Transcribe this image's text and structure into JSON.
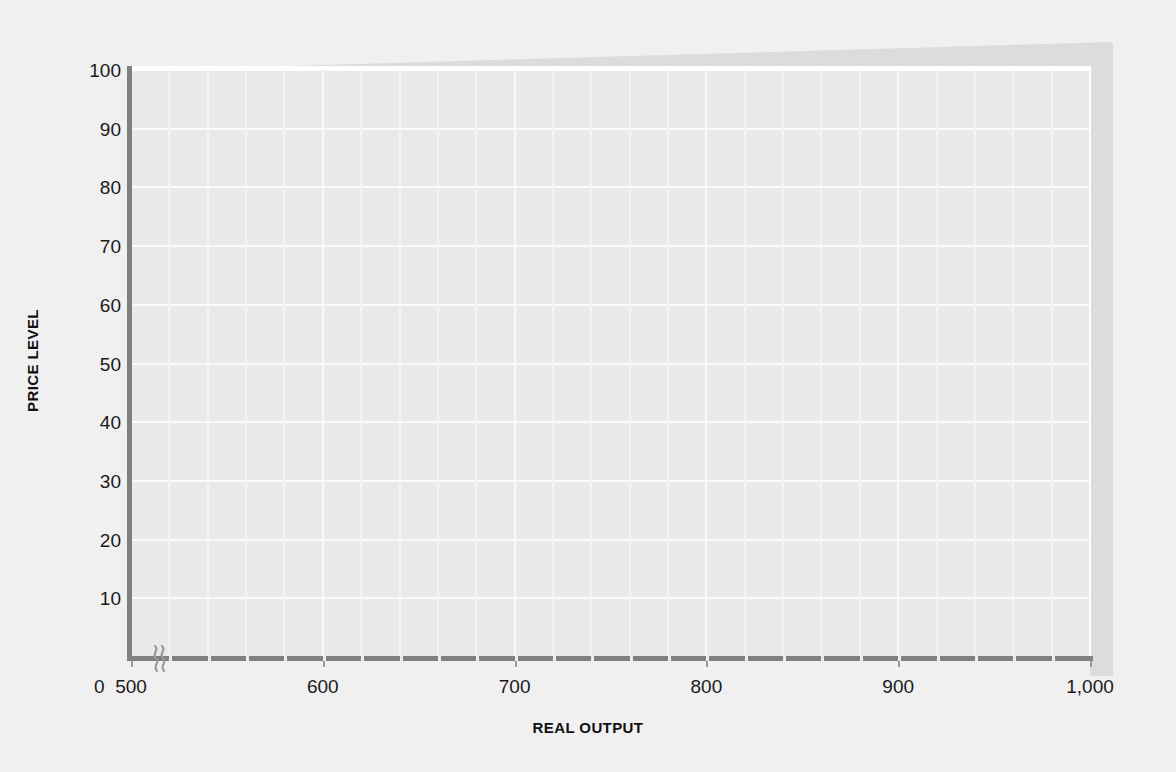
{
  "chart_data": {
    "type": "line",
    "title": "",
    "subtitle": "",
    "xlabel": "REAL OUTPUT",
    "ylabel": "PRICE LEVEL",
    "xlim": [
      500,
      1000
    ],
    "ylim": [
      0,
      100
    ],
    "x_ticks": [
      500,
      600,
      700,
      800,
      900,
      1000
    ],
    "x_tick_labels": [
      "500",
      "600",
      "700",
      "800",
      "900",
      "1,000"
    ],
    "x_origin_label": "0",
    "x_axis_break": true,
    "y_ticks": [
      10,
      20,
      30,
      40,
      50,
      60,
      70,
      80,
      90,
      100
    ],
    "y_tick_labels": [
      "10",
      "20",
      "30",
      "40",
      "50",
      "60",
      "70",
      "80",
      "90",
      "100"
    ],
    "grid": true,
    "legend": "none",
    "series": [],
    "annotations": [],
    "colors": {
      "page_background": "#f0f0f0",
      "plot_background": "#eaeaea",
      "gridline": "#fbfbfb",
      "axis_line": "#808080",
      "bevel": "#dcdcdc",
      "text": "#1a1a1a"
    }
  },
  "figure": {
    "y_axis_title": "PRICE LEVEL",
    "x_axis_title": "REAL OUTPUT",
    "origin_label": "0",
    "y_labels": [
      "100",
      "90",
      "80",
      "70",
      "60",
      "50",
      "40",
      "30",
      "20",
      "10"
    ],
    "x_labels": [
      "500",
      "600",
      "700",
      "800",
      "900",
      "1,000"
    ],
    "break_icon": "axis-break-squiggle"
  }
}
